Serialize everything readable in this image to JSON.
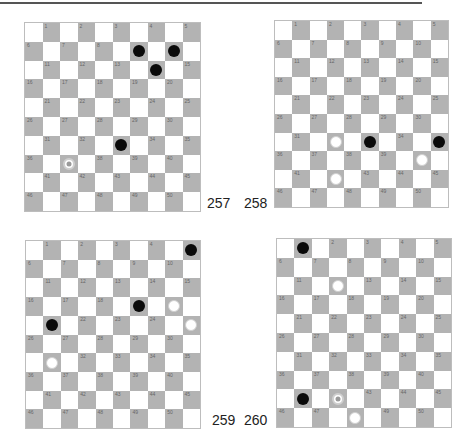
{
  "colors": {
    "dark_square": "#b3b3b3",
    "light_square": "#ffffff",
    "black_piece": "#0a0a0a",
    "white_piece": "#ffffff"
  },
  "boards": [
    {
      "label": "257",
      "rect": {
        "x": 24,
        "y": 22,
        "w": 177,
        "h": 190
      },
      "label_pos": {
        "x": 207,
        "y": 196
      },
      "black": [
        9,
        10,
        14,
        33
      ],
      "white": [],
      "marked": [
        37
      ]
    },
    {
      "label": "258",
      "rect": {
        "x": 274,
        "y": 20,
        "w": 175,
        "h": 188
      },
      "label_pos": {
        "x": 244,
        "y": 196
      },
      "black": [
        33,
        35
      ],
      "white": [
        32,
        40,
        42
      ],
      "marked": []
    },
    {
      "label": "259",
      "rect": {
        "x": 25,
        "y": 240,
        "w": 176,
        "h": 189
      },
      "label_pos": {
        "x": 212,
        "y": 413
      },
      "black": [
        5,
        19,
        21
      ],
      "white": [
        20,
        25,
        31
      ],
      "marked": []
    },
    {
      "label": "260",
      "rect": {
        "x": 276,
        "y": 238,
        "w": 176,
        "h": 190
      },
      "label_pos": {
        "x": 244,
        "y": 413
      },
      "black": [
        1,
        41
      ],
      "white": [
        12,
        48
      ],
      "marked": [
        42
      ]
    }
  ]
}
